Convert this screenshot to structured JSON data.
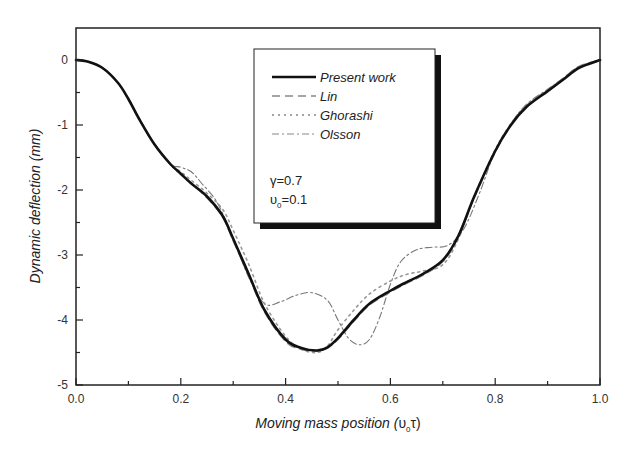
{
  "chart_data": {
    "type": "line",
    "title": "",
    "xlabel": "Moving mass position (υ₀τ)",
    "xlabel_main": "Moving mass position (",
    "xlabel_sym": "υ",
    "xlabel_sub": "0",
    "xlabel_tail": "τ)",
    "ylabel": "Dynamic deflection (mm)",
    "xlim": [
      0.0,
      1.0
    ],
    "ylim": [
      -5,
      0.5
    ],
    "xticks": [
      0.0,
      0.2,
      0.4,
      0.6,
      0.8,
      1.0
    ],
    "xtick_labels": [
      "0.0",
      "0.2",
      "0.4",
      "0.6",
      "0.8",
      "1.0"
    ],
    "yticks": [
      0,
      -1,
      -2,
      -3,
      -4,
      -5
    ],
    "ytick_labels": [
      "0",
      "-1",
      "-2",
      "-3",
      "-4",
      "-5"
    ],
    "grid": false,
    "legend_position": "upper center (boxed with shadow)",
    "annotations": [
      "γ=0.7",
      "υ₀=0.1"
    ],
    "series": [
      {
        "name": "Present work",
        "style": "solid",
        "color": "#111111",
        "x": [
          0.0,
          0.02,
          0.05,
          0.08,
          0.1,
          0.12,
          0.15,
          0.18,
          0.2,
          0.22,
          0.25,
          0.28,
          0.3,
          0.33,
          0.36,
          0.4,
          0.43,
          0.46,
          0.48,
          0.5,
          0.53,
          0.56,
          0.6,
          0.63,
          0.66,
          0.7,
          0.73,
          0.76,
          0.8,
          0.83,
          0.86,
          0.9,
          0.93,
          0.96,
          1.0
        ],
        "y": [
          0.0,
          -0.02,
          -0.12,
          -0.35,
          -0.6,
          -0.9,
          -1.3,
          -1.6,
          -1.75,
          -1.9,
          -2.1,
          -2.4,
          -2.75,
          -3.3,
          -3.85,
          -4.3,
          -4.43,
          -4.47,
          -4.42,
          -4.28,
          -4.0,
          -3.75,
          -3.55,
          -3.42,
          -3.3,
          -3.08,
          -2.7,
          -2.1,
          -1.4,
          -1.0,
          -0.72,
          -0.48,
          -0.3,
          -0.12,
          0.0
        ]
      },
      {
        "name": "Lin",
        "style": "dashed",
        "color": "#888888",
        "x": [
          0.0,
          0.02,
          0.05,
          0.08,
          0.1,
          0.12,
          0.15,
          0.18,
          0.2,
          0.22,
          0.25,
          0.28,
          0.3,
          0.33,
          0.36,
          0.4,
          0.43,
          0.46,
          0.48,
          0.5,
          0.53,
          0.56,
          0.6,
          0.63,
          0.66,
          0.7,
          0.73,
          0.76,
          0.8,
          0.83,
          0.86,
          0.9,
          0.93,
          0.96,
          1.0
        ],
        "y": [
          0.0,
          -0.02,
          -0.12,
          -0.35,
          -0.6,
          -0.9,
          -1.3,
          -1.6,
          -1.76,
          -1.9,
          -2.12,
          -2.42,
          -2.78,
          -3.33,
          -3.88,
          -4.33,
          -4.45,
          -4.48,
          -4.43,
          -4.3,
          -4.02,
          -3.77,
          -3.57,
          -3.44,
          -3.32,
          -3.1,
          -2.72,
          -2.12,
          -1.42,
          -1.0,
          -0.7,
          -0.46,
          -0.28,
          -0.1,
          0.0
        ]
      },
      {
        "name": "Ghorashi",
        "style": "dotted",
        "color": "#999999",
        "x": [
          0.0,
          0.02,
          0.05,
          0.08,
          0.1,
          0.12,
          0.15,
          0.18,
          0.2,
          0.22,
          0.25,
          0.28,
          0.3,
          0.33,
          0.36,
          0.4,
          0.43,
          0.46,
          0.48,
          0.5,
          0.53,
          0.56,
          0.6,
          0.63,
          0.66,
          0.7,
          0.73,
          0.76,
          0.8,
          0.83,
          0.86,
          0.9,
          0.93,
          0.96,
          1.0
        ],
        "y": [
          0.0,
          -0.02,
          -0.12,
          -0.35,
          -0.6,
          -0.9,
          -1.3,
          -1.6,
          -1.72,
          -1.85,
          -2.05,
          -2.3,
          -2.62,
          -3.15,
          -3.75,
          -4.25,
          -4.45,
          -4.5,
          -4.4,
          -4.15,
          -3.85,
          -3.6,
          -3.4,
          -3.3,
          -3.25,
          -3.15,
          -2.75,
          -2.1,
          -1.38,
          -0.98,
          -0.7,
          -0.47,
          -0.29,
          -0.11,
          0.0
        ]
      },
      {
        "name": "Olsson",
        "style": "dash-dot",
        "color": "#777777",
        "x": [
          0.0,
          0.02,
          0.05,
          0.08,
          0.1,
          0.12,
          0.15,
          0.18,
          0.2,
          0.22,
          0.24,
          0.27,
          0.3,
          0.33,
          0.36,
          0.39,
          0.42,
          0.45,
          0.48,
          0.5,
          0.52,
          0.54,
          0.56,
          0.58,
          0.6,
          0.62,
          0.65,
          0.68,
          0.71,
          0.74,
          0.77,
          0.8,
          0.83,
          0.86,
          0.9,
          0.93,
          0.96,
          1.0
        ],
        "y": [
          0.0,
          -0.02,
          -0.12,
          -0.35,
          -0.6,
          -0.9,
          -1.3,
          -1.6,
          -1.65,
          -1.72,
          -1.9,
          -2.2,
          -2.75,
          -3.35,
          -3.75,
          -3.72,
          -3.62,
          -3.58,
          -3.7,
          -4.0,
          -4.28,
          -4.38,
          -4.3,
          -3.95,
          -3.45,
          -3.1,
          -2.92,
          -2.88,
          -2.85,
          -2.6,
          -2.05,
          -1.4,
          -0.98,
          -0.68,
          -0.45,
          -0.28,
          -0.1,
          0.0
        ]
      }
    ]
  },
  "legend": {
    "items": [
      {
        "label": "Present work",
        "style": "solid"
      },
      {
        "label": "Lin",
        "style": "dashed"
      },
      {
        "label": "Ghorashi",
        "style": "dotted"
      },
      {
        "label": "Olsson",
        "style": "dash-dot"
      }
    ],
    "param_gamma": "γ=0.7",
    "param_v_sym": "υ",
    "param_v_sub": "0",
    "param_v_val": "=0.1"
  },
  "colors": {
    "axis": "#222222",
    "background": "#ffffff",
    "legend_shadow": "#111111"
  }
}
